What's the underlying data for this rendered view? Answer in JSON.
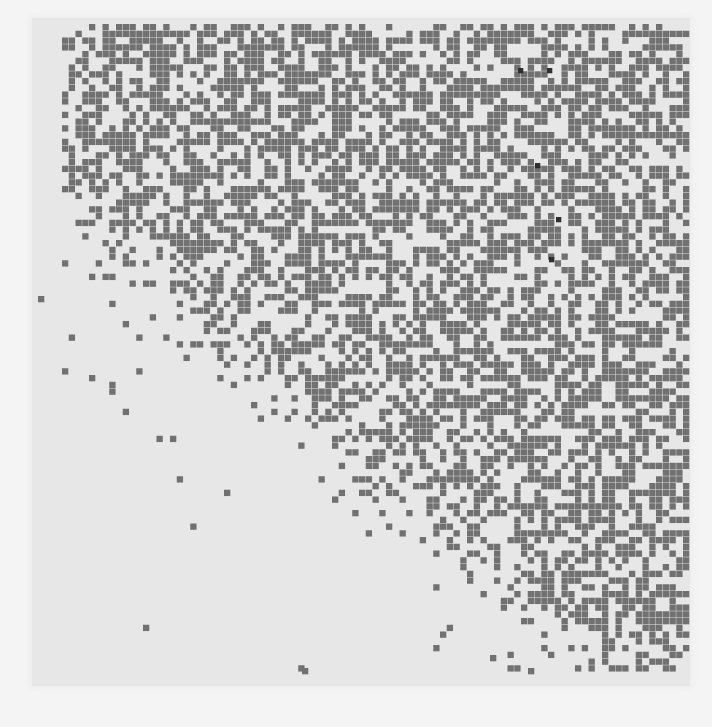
{
  "figure": {
    "background_color": "#f4f4f4",
    "panel": {
      "x": 32,
      "y": 18,
      "width": 658,
      "height": 668,
      "color": "#e7e7e7"
    },
    "grid": {
      "origin_x": 62,
      "origin_y": 24,
      "cols": 93,
      "rows": 96,
      "cell_pitch": 6.75,
      "cell_size": 6.3,
      "cell_color": "#717171",
      "dark_cell_color": "#2f2f2f",
      "seed": 1979,
      "density": {
        "model": "diagonal-front",
        "max_fill": 0.56,
        "front_start": [
          0,
          26
        ],
        "front_end": [
          80,
          96
        ],
        "front_width": 9,
        "sparse_tail": 0.05
      }
    },
    "isolated_cells": [
      {
        "x": 38,
        "y": 296
      },
      {
        "x": 302,
        "y": 668
      },
      {
        "x": 528,
        "y": 668
      },
      {
        "x": 490,
        "y": 655
      }
    ],
    "dark_cells": [
      {
        "x": 547,
        "y": 68
      },
      {
        "x": 535,
        "y": 163
      },
      {
        "x": 556,
        "y": 217
      },
      {
        "x": 549,
        "y": 257
      },
      {
        "x": 518,
        "y": 68
      }
    ]
  }
}
